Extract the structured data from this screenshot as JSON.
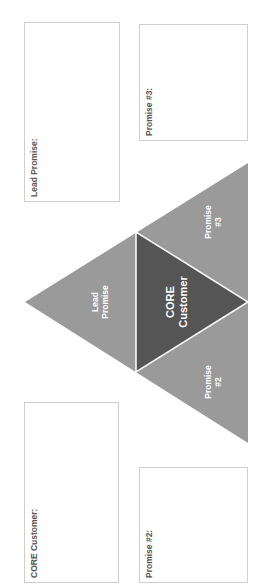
{
  "boxes": {
    "lead_promise": {
      "label": "Lead Promise:"
    },
    "promise_3": {
      "label": "Promise #3:"
    },
    "core_customer": {
      "label": "CORE Customer:"
    },
    "promise_2": {
      "label": "Promise #2:"
    }
  },
  "triangle": {
    "lead": {
      "line1": "Lead",
      "line2": "Promise"
    },
    "promise_3": {
      "line1": "Promise",
      "line2": "#3"
    },
    "promise_2": {
      "line1": "Promise",
      "line2": "#2"
    },
    "core": {
      "line1": "CORE",
      "line2": "Customer"
    }
  },
  "colors": {
    "outer_triangle": "#9a9a9a",
    "inner_triangle": "#555555",
    "divider": "#ffffff",
    "box_border": "#cfcfcf"
  }
}
